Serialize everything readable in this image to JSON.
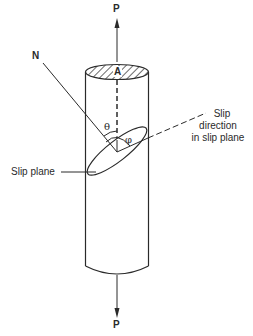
{
  "figure": {
    "type": "schematic"
  },
  "labels": {
    "load_top": "P",
    "load_bottom": "P",
    "normal": "N",
    "area": "A",
    "theta": "θ",
    "phi": "φ",
    "slip_direction_line1": "Slip",
    "slip_direction_line2": "direction",
    "slip_direction_line3": "in slip plane",
    "slip_plane": "Slip plane"
  },
  "colors": {
    "stroke": "#2a2a2a",
    "background": "#ffffff"
  }
}
